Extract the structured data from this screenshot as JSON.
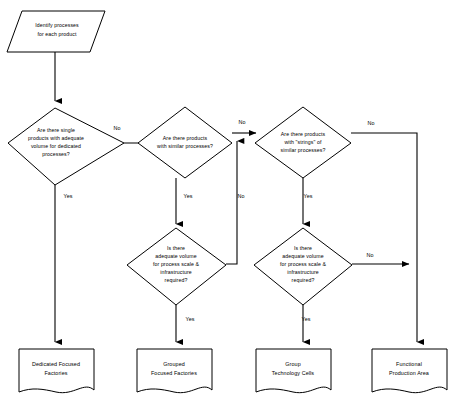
{
  "diagram": {
    "stroke_color": "#000000",
    "fill_color": "#ffffff"
  },
  "nodes": {
    "start": {
      "shape": "parallelogram",
      "lines": [
        "Identify processes",
        "for each product"
      ]
    },
    "decision1": {
      "shape": "diamond",
      "lines": [
        "Are there single",
        "products with adequate",
        "volume for dedicated",
        "processes?"
      ]
    },
    "decision2": {
      "shape": "diamond",
      "lines": [
        "Are there products",
        "with similar processes?"
      ]
    },
    "decision3": {
      "shape": "diamond",
      "lines": [
        "Are there products",
        "with \"strings\" of",
        "similar processes?"
      ]
    },
    "decision4": {
      "shape": "diamond",
      "lines": [
        "Is there",
        "adequate volume",
        "for process scale &",
        "infrastructure",
        "required?"
      ]
    },
    "decision5": {
      "shape": "diamond",
      "lines": [
        "Is there",
        "adequate volume",
        "for process scale &",
        "infrastructure",
        "required?"
      ]
    },
    "outcome1": {
      "shape": "document",
      "lines": [
        "Dedicated Focused",
        "Factories"
      ]
    },
    "outcome2": {
      "shape": "document",
      "lines": [
        "Grouped",
        "Focused Factories"
      ]
    },
    "outcome3": {
      "shape": "document",
      "lines": [
        "Group",
        "Technology Cells"
      ]
    },
    "outcome4": {
      "shape": "document",
      "lines": [
        "Functional",
        "Production Area"
      ]
    }
  },
  "edge_labels": {
    "d1_no": "No",
    "d1_yes": "Yes",
    "d2_no": "No",
    "d2_yes": "Yes",
    "d3_no": "No",
    "d3_yes": "Yes",
    "d4_no": "No",
    "d4_yes": "Yes",
    "d5_no": "No",
    "d5_yes": "Yes"
  }
}
